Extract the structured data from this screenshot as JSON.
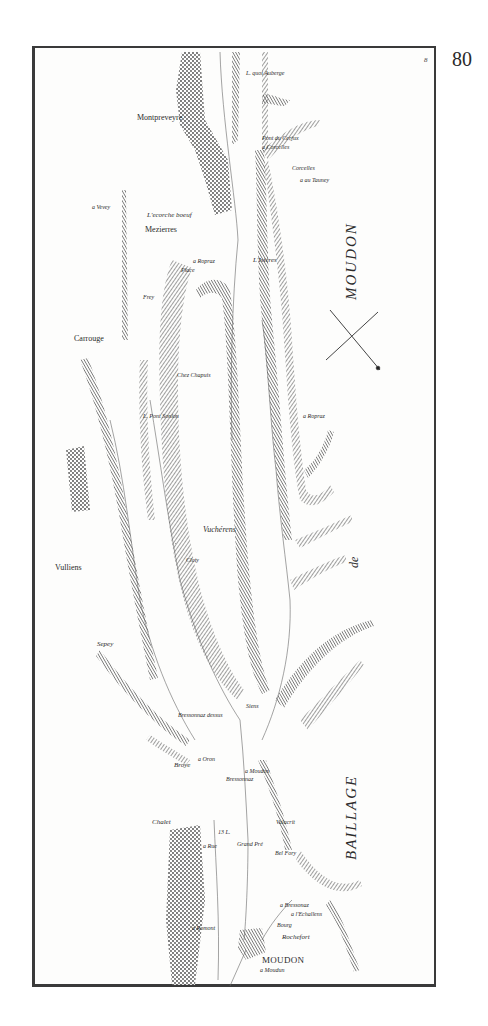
{
  "page": {
    "page_number": "80",
    "sheet_number": "8"
  },
  "map": {
    "region_label_vertical_top": "MOUDON",
    "region_label_middle": "de",
    "region_label_vertical_bottom": "BAILLAGE",
    "compass": "compass-cross",
    "places": [
      {
        "id": "laquo-auberge",
        "label": "L. quoi Auberge",
        "x": 246,
        "y": 70,
        "cls": "s6"
      },
      {
        "id": "montpreveyre",
        "label": "Montpreveyre",
        "x": 137,
        "y": 114,
        "cls": "s8 roman"
      },
      {
        "id": "pont-du-cerjux",
        "label": "Pont du Cerjux",
        "x": 262,
        "y": 135,
        "cls": "s6"
      },
      {
        "id": "a-corcelles",
        "label": "a Corcelles",
        "x": 262,
        "y": 144,
        "cls": "s6"
      },
      {
        "id": "corcelles",
        "label": "Corcelles",
        "x": 292,
        "y": 165,
        "cls": "s6"
      },
      {
        "id": "a-au-tauney",
        "label": "a au Tauney",
        "x": 300,
        "y": 177,
        "cls": "s6"
      },
      {
        "id": "a-vevey",
        "label": "a Vevey",
        "x": 92,
        "y": 204,
        "cls": "s6"
      },
      {
        "id": "lecorche-boeuf",
        "label": "L'ecorche boeuf",
        "x": 147,
        "y": 212,
        "cls": "s7"
      },
      {
        "id": "mezierres",
        "label": "Mezierres",
        "x": 145,
        "y": 226,
        "cls": "s8 roman"
      },
      {
        "id": "a-ropraz-1",
        "label": "a Ropraz",
        "x": 193,
        "y": 258,
        "cls": "s6"
      },
      {
        "id": "place",
        "label": "Place",
        "x": 181,
        "y": 267,
        "cls": "s6"
      },
      {
        "id": "lisieres",
        "label": "L'Isières",
        "x": 253,
        "y": 257,
        "cls": "s7"
      },
      {
        "id": "frey",
        "label": "Frey",
        "x": 143,
        "y": 294,
        "cls": "s6"
      },
      {
        "id": "carrouge",
        "label": "Carrouge",
        "x": 74,
        "y": 335,
        "cls": "s8 roman"
      },
      {
        "id": "chez-chapuis",
        "label": "Chez Chapuis",
        "x": 177,
        "y": 372,
        "cls": "s6"
      },
      {
        "id": "lpont-sonlon",
        "label": "L. Pont   Sonlon",
        "x": 143,
        "y": 413,
        "cls": "s6"
      },
      {
        "id": "a-ropraz-2",
        "label": "a Ropraz",
        "x": 303,
        "y": 413,
        "cls": "s6"
      },
      {
        "id": "vucherens",
        "label": "Vuchérens",
        "x": 203,
        "y": 526,
        "cls": "s8"
      },
      {
        "id": "cloty",
        "label": "Cloty",
        "x": 186,
        "y": 557,
        "cls": "s6"
      },
      {
        "id": "vulliens",
        "label": "Vulliens",
        "x": 55,
        "y": 564,
        "cls": "s8 roman"
      },
      {
        "id": "sepey",
        "label": "Sepey",
        "x": 97,
        "y": 641,
        "cls": "s7"
      },
      {
        "id": "siens",
        "label": "Siens",
        "x": 246,
        "y": 703,
        "cls": "s6"
      },
      {
        "id": "bressonnaz-dessus",
        "label": "Bressonnaz dessus",
        "x": 178,
        "y": 712,
        "cls": "s6"
      },
      {
        "id": "a-oron",
        "label": "a Oron",
        "x": 198,
        "y": 756,
        "cls": "s6"
      },
      {
        "id": "broye",
        "label": "Broye",
        "x": 174,
        "y": 762,
        "cls": "s7"
      },
      {
        "id": "a-moudon-1",
        "label": "a Moudon",
        "x": 245,
        "y": 768,
        "cls": "s6"
      },
      {
        "id": "bressonnaz",
        "label": "Bressonnaz",
        "x": 226,
        "y": 776,
        "cls": "s6"
      },
      {
        "id": "chalet",
        "label": "Chalet",
        "x": 152,
        "y": 819,
        "cls": "s7"
      },
      {
        "id": "valacrit",
        "label": "Valacrit",
        "x": 276,
        "y": 819,
        "cls": "s6"
      },
      {
        "id": "13-l",
        "label": "13 L.",
        "x": 218,
        "y": 829,
        "cls": "s6"
      },
      {
        "id": "grand-pre",
        "label": "Grand Pré",
        "x": 237,
        "y": 841,
        "cls": "s6"
      },
      {
        "id": "a-rue",
        "label": "a Rue",
        "x": 203,
        "y": 843,
        "cls": "s6"
      },
      {
        "id": "bel-fory",
        "label": "Bel Fory",
        "x": 275,
        "y": 850,
        "cls": "s6"
      },
      {
        "id": "a-bressonaz",
        "label": "a Bressonaz",
        "x": 280,
        "y": 902,
        "cls": "s6"
      },
      {
        "id": "a-lechallens",
        "label": "a l'Echallens",
        "x": 291,
        "y": 911,
        "cls": "s6"
      },
      {
        "id": "bourg",
        "label": "Bourg",
        "x": 277,
        "y": 922,
        "cls": "s6"
      },
      {
        "id": "a-romont",
        "label": "a Romont",
        "x": 192,
        "y": 925,
        "cls": "s6"
      },
      {
        "id": "rochefort",
        "label": "Rochefort",
        "x": 282,
        "y": 934,
        "cls": "s7"
      },
      {
        "id": "moudon-town",
        "label": "MOUDON",
        "x": 262,
        "y": 956,
        "cls": "s9 roman"
      },
      {
        "id": "a-moudon-2",
        "label": "a Moudun",
        "x": 260,
        "y": 967,
        "cls": "s6"
      }
    ]
  }
}
